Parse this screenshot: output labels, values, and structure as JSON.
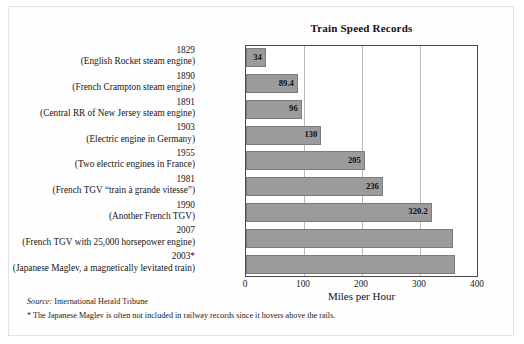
{
  "chart_data": {
    "type": "bar",
    "orientation": "horizontal",
    "title": "Train Speed Records",
    "xlabel": "Miles per Hour",
    "ylabel": "",
    "xlim": [
      0,
      400
    ],
    "xticks": [
      0,
      100,
      200,
      300,
      400
    ],
    "xtick_labels": [
      "0",
      "100",
      "200",
      "300",
      "400"
    ],
    "grid": "vertical",
    "legend": "none",
    "bar_color": "#9b9b9b",
    "bar_edge_color": "#7b7b7b",
    "categories": [
      "1829 (English Rocket steam engine)",
      "1890 (French Crampton steam engine)",
      "1891 (Central RR of New Jersey steam engine)",
      "1903 (Electric engine in Germany)",
      "1955 (Two electric engines in France)",
      "1981 (French TGV “train à grande vitesse”)",
      "1990 (Another French TGV)",
      "2007 (French TGV with 25,000 horsepower engine)",
      "2003* (Japanese Maglev, a magnetically levitated train)"
    ],
    "values": [
      34,
      89.4,
      96,
      130,
      205,
      236,
      320.2,
      357,
      361
    ],
    "rows": [
      {
        "year": "1829",
        "desc": "(English Rocket steam engine)",
        "value": 34,
        "label": "34"
      },
      {
        "year": "1890",
        "desc": "(French Crampton steam engine)",
        "value": 89.4,
        "label": "89.4"
      },
      {
        "year": "1891",
        "desc": "(Central RR of New Jersey steam engine)",
        "value": 96,
        "label": "96"
      },
      {
        "year": "1903",
        "desc": "(Electric engine in Germany)",
        "value": 130,
        "label": "130"
      },
      {
        "year": "1955",
        "desc": "(Two electric engines in France)",
        "value": 205,
        "label": "205"
      },
      {
        "year": "1981",
        "desc": "(French TGV “train à grande vitesse”)",
        "value": 236,
        "label": "236"
      },
      {
        "year": "1990",
        "desc": "(Another French TGV)",
        "value": 320.2,
        "label": "320.2"
      },
      {
        "year": "2007",
        "desc": "(French TGV with 25,000 horsepower engine)",
        "value": 357,
        "label": ""
      },
      {
        "year": "2003*",
        "desc": "(Japanese Maglev, a magnetically levitated train)",
        "value": 361,
        "label": ""
      }
    ]
  },
  "footer": {
    "source_keyword": "Source:",
    "source_text": " International Herald Tribune",
    "footnote": "* The Japanese Maglev is often not included in railway records since it hovers above the rails."
  }
}
